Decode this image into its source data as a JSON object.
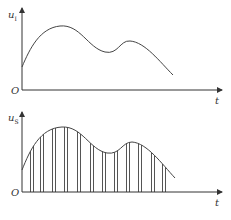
{
  "top_plot": {
    "y_label": "u",
    "y_label_sub": "I",
    "x_label": "t",
    "origin_label": "O",
    "curve_path": "M22,67 C30,48 40,28 60,26 C80,24 88,48 105,52 C118,55 120,40 130,41 C145,42 160,62 173,75"
  },
  "bottom_plot": {
    "y_label": "u",
    "y_label_sub": "S",
    "x_label": "t",
    "origin_label": "O",
    "curve_path": "M22,170 C30,150 40,128 62,127 C82,126 90,150 107,153 C120,155 122,142 132,142 C147,143 162,164 175,178",
    "sample_times_x": [
      32,
      42,
      54,
      66,
      79,
      92,
      104,
      116,
      128,
      140,
      153,
      164
    ],
    "sample_width": 3
  },
  "colors": {
    "axis": "#333333",
    "curve": "#444444",
    "pulse": "#555555",
    "background": "#ffffff"
  }
}
